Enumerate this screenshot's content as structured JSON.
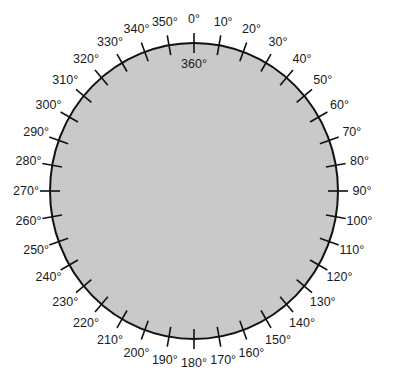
{
  "diagram": {
    "start_degree": 0,
    "end_degree": 350,
    "step": 10,
    "labels": [
      "0°",
      "10°",
      "20°",
      "30°",
      "40°",
      "50°",
      "60°",
      "70°",
      "80°",
      "90°",
      "100°",
      "110°",
      "120°",
      "130°",
      "140°",
      "150°",
      "160°",
      "170°",
      "180°",
      "190°",
      "200°",
      "210°",
      "220°",
      "230°",
      "240°",
      "250°",
      "260°",
      "270°",
      "280°",
      "290°",
      "300°",
      "310°",
      "320°",
      "330°",
      "340°",
      "350°"
    ],
    "inner_label": "360°",
    "fill_color": "#c9c9c9",
    "stroke_color": "#111111"
  }
}
